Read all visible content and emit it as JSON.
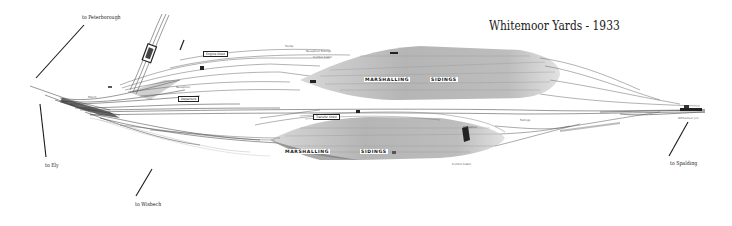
{
  "title": "Whitemoor Yards - 1933",
  "destinations": {
    "peterborough": "to Peterborough",
    "ely": "to Ely",
    "wisbech": "to Wisbech",
    "spalding": "to Spalding"
  },
  "yards": {
    "up_marshalling": "MARSHALLING",
    "up_sidings": "SIDINGS",
    "down_marshalling": "MARSHALLING",
    "down_sidings": "SIDINGS"
  },
  "buildings": {
    "engine_shed_upper": "Engine Shed",
    "engine_shed_lower": "Transfer Shed",
    "reception_upper": "Reception",
    "reception_lower_right": "Reception",
    "departure": "Departure",
    "control_cabin": "Control Cabin",
    "hump": "Hump",
    "reception_sidings": "Reception Sidings",
    "control_cabin_lower": "Control Cabin",
    "march_station": "March",
    "down_sidings": "Sidings",
    "whitemoor_junction": "Whitemoor Jcn"
  },
  "colors": {
    "background": "#ffffff",
    "track": "#3a3a3a",
    "yard_fill": "#b8b8b8",
    "yard_dark": "#8c8c8c",
    "leader_line": "#1a1a1a"
  }
}
